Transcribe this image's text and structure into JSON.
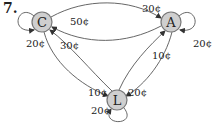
{
  "problem": {
    "number": "7."
  },
  "nodes": [
    {
      "id": "C",
      "label": "C",
      "x": 42,
      "y": 22
    },
    {
      "id": "A",
      "label": "A",
      "x": 171,
      "y": 22
    },
    {
      "id": "L",
      "label": "L",
      "x": 117,
      "y": 100
    }
  ],
  "edges": [
    {
      "from": "C",
      "to": "A",
      "label": "30¢"
    },
    {
      "from": "A",
      "to": "C",
      "label": "50¢"
    },
    {
      "from": "L",
      "to": "C",
      "label": "30¢"
    },
    {
      "from": "C",
      "to": "L",
      "label": "10¢"
    },
    {
      "from": "L",
      "to": "A",
      "label": "10¢"
    },
    {
      "from": "A",
      "to": "L",
      "label": "20¢"
    },
    {
      "from": "C",
      "to": "C",
      "label": "20¢"
    },
    {
      "from": "A",
      "to": "A",
      "label": "20¢"
    },
    {
      "from": "L",
      "to": "L",
      "label": "20¢"
    }
  ],
  "colors": {
    "node_fill": "#cfcfcf",
    "edge": "#555555"
  }
}
